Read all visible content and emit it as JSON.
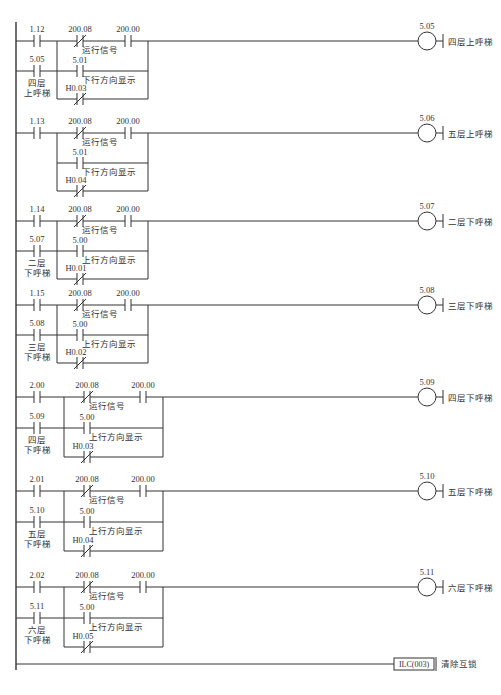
{
  "diagram": {
    "type": "PLC ladder diagram",
    "colors": {
      "line": "#333333",
      "background": "#ffffff"
    },
    "rungs": [
      {
        "main_contact": {
          "addr": "1.12",
          "type": "NO"
        },
        "parallel_contact": {
          "addr": "5.05",
          "type": "NO",
          "label": [
            "四层",
            "上呼梯"
          ]
        },
        "run_signal": {
          "addr": "200.08",
          "type": "NC",
          "label": "运行信号"
        },
        "series_contact": {
          "addr": "200.00",
          "type": "NO"
        },
        "direction_contact": {
          "addr": "5.01",
          "type": "NO",
          "label": "下行方向显示"
        },
        "hold_contact": {
          "addr": "H0.03",
          "type": "NC"
        },
        "coil": {
          "addr": "5.05",
          "label": "四层上呼梯"
        }
      },
      {
        "main_contact": {
          "addr": "1.13",
          "type": "NO"
        },
        "parallel_contact": null,
        "run_signal": {
          "addr": "200.08",
          "type": "NC",
          "label": "运行信号"
        },
        "series_contact": {
          "addr": "200.00",
          "type": "NO"
        },
        "direction_contact": {
          "addr": "5.01",
          "type": "NO",
          "label": "下行方向显示"
        },
        "hold_contact": {
          "addr": "H0.04",
          "type": "NC"
        },
        "coil": {
          "addr": "5.06",
          "label": "五层上呼梯"
        }
      },
      {
        "main_contact": {
          "addr": "1.14",
          "type": "NO"
        },
        "parallel_contact": {
          "addr": "5.07",
          "type": "NO",
          "label": [
            "二层",
            "下呼梯"
          ]
        },
        "run_signal": {
          "addr": "200.08",
          "type": "NC",
          "label": "运行信号"
        },
        "series_contact": {
          "addr": "200.00",
          "type": "NO"
        },
        "direction_contact": {
          "addr": "5.00",
          "type": "NO",
          "label": "上行方向显示"
        },
        "hold_contact": {
          "addr": "H0.01",
          "type": "NC"
        },
        "coil": {
          "addr": "5.07",
          "label": "二层下呼梯"
        }
      },
      {
        "main_contact": {
          "addr": "1.15",
          "type": "NO"
        },
        "parallel_contact": {
          "addr": "5.08",
          "type": "NO",
          "label": [
            "三层",
            "下呼梯"
          ]
        },
        "run_signal": {
          "addr": "200.08",
          "type": "NC",
          "label": "运行信号"
        },
        "series_contact": {
          "addr": "200.00",
          "type": "NO"
        },
        "direction_contact": {
          "addr": "5.00",
          "type": "NO",
          "label": "上行方向显示"
        },
        "hold_contact": {
          "addr": "H0.02",
          "type": "NC"
        },
        "coil": {
          "addr": "5.08",
          "label": "三层下呼梯"
        }
      },
      {
        "main_contact": {
          "addr": "2.00",
          "type": "NO"
        },
        "parallel_contact": {
          "addr": "5.09",
          "type": "NO",
          "label": [
            "四层",
            "下呼梯"
          ]
        },
        "run_signal": {
          "addr": "200.08",
          "type": "NC",
          "label": "运行信号"
        },
        "series_contact": {
          "addr": "200.00",
          "type": "NO"
        },
        "direction_contact": {
          "addr": "5.00",
          "type": "NO",
          "label": "上行方向显示"
        },
        "hold_contact": {
          "addr": "H0.03",
          "type": "NC"
        },
        "coil": {
          "addr": "5.09",
          "label": "四层下呼梯"
        }
      },
      {
        "main_contact": {
          "addr": "2.01",
          "type": "NO"
        },
        "parallel_contact": {
          "addr": "5.10",
          "type": "NO",
          "label": [
            "五层",
            "下呼梯"
          ]
        },
        "run_signal": {
          "addr": "200.08",
          "type": "NC",
          "label": "运行信号"
        },
        "series_contact": {
          "addr": "200.00",
          "type": "NO"
        },
        "direction_contact": {
          "addr": "5.00",
          "type": "NO",
          "label": "上行方向显示"
        },
        "hold_contact": {
          "addr": "H0.04",
          "type": "NC"
        },
        "coil": {
          "addr": "5.10",
          "label": "五层下呼梯"
        }
      },
      {
        "main_contact": {
          "addr": "2.02",
          "type": "NO"
        },
        "parallel_contact": {
          "addr": "5.11",
          "type": "NO",
          "label": [
            "六层",
            "下呼梯"
          ]
        },
        "run_signal": {
          "addr": "200.08",
          "type": "NC",
          "label": "运行信号"
        },
        "series_contact": {
          "addr": "200.00",
          "type": "NO"
        },
        "direction_contact": {
          "addr": "5.00",
          "type": "NO",
          "label": "上行方向显示"
        },
        "hold_contact": {
          "addr": "H0.05",
          "type": "NC"
        },
        "coil": {
          "addr": "5.11",
          "label": "六层下呼梯"
        }
      }
    ],
    "final_instruction": {
      "instruction": "ILC(003)",
      "label": "清除互锁"
    }
  }
}
